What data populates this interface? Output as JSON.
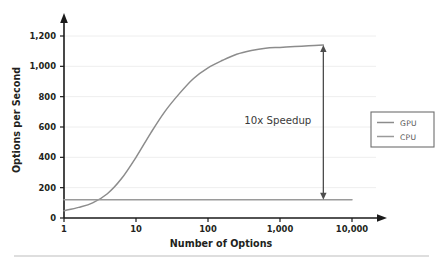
{
  "chart_data": {
    "type": "line",
    "title": "",
    "xlabel": "Number of Options",
    "ylabel": "Options per Second",
    "xscale": "log",
    "xlim": [
      1,
      10000
    ],
    "ylim": [
      0,
      1300
    ],
    "grid": true,
    "xticks": [
      "1",
      "10",
      "100",
      "1,000",
      "10,000"
    ],
    "xtick_values": [
      1,
      10,
      100,
      1000,
      10000
    ],
    "yticks": [
      "0",
      "200",
      "400",
      "600",
      "800",
      "1,000",
      "1,200"
    ],
    "ytick_values": [
      0,
      200,
      400,
      600,
      800,
      1000,
      1200
    ],
    "legend_position": "right-outside",
    "series": [
      {
        "name": "GPU",
        "color": "#8c8c8c",
        "x": [
          1,
          1.6,
          2.5,
          4,
          6.3,
          10,
          16,
          25,
          40,
          63,
          100,
          160,
          250,
          400,
          630,
          1000,
          1600,
          2500,
          4000
        ],
        "values": [
          48,
          70,
          100,
          160,
          260,
          400,
          560,
          700,
          820,
          920,
          990,
          1040,
          1080,
          1105,
          1120,
          1125,
          1130,
          1135,
          1140
        ]
      },
      {
        "name": "CPU",
        "color": "#9a9a9a",
        "x": [
          1,
          10000
        ],
        "values": [
          120,
          120
        ]
      }
    ],
    "annotations": [
      {
        "name": "speedup",
        "text": "10x Speedup",
        "arrow_x": 4000,
        "arrow_y_top": 1140,
        "arrow_y_bottom": 120,
        "color": "#4d4d4d"
      }
    ]
  },
  "legend": {
    "entries": [
      {
        "label": "GPU"
      },
      {
        "label": "CPU"
      }
    ]
  },
  "axes": {
    "y_title": "Options per Second",
    "x_title": "Number of Options"
  },
  "colors": {
    "gpu_line": "#8c8c8c",
    "cpu_line": "#9a9a9a",
    "axis": "#1a1a1a",
    "grid": "#eeeeee",
    "annotation": "#4d4d4d",
    "footer_rule": "#bdbdbd",
    "background": "#ffffff"
  },
  "footer": {
    "rule_visible": true
  }
}
